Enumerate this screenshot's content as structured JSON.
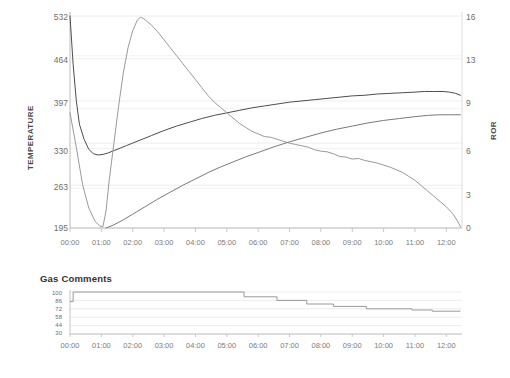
{
  "chart_data": [
    {
      "id": "roast-profile",
      "type": "line",
      "title": "",
      "xlabel": "",
      "ylabel": "TEMPERATURE",
      "y2label": "ROR",
      "grid": true,
      "legend": "none",
      "x_ticks": [
        "00:00",
        "01:00",
        "02:00",
        "03:00",
        "04:00",
        "05:00",
        "06:00",
        "07:00",
        "08:00",
        "09:00",
        "10:00",
        "11:00",
        "12:00"
      ],
      "xlim": [
        0,
        12.5
      ],
      "y_ticks": [
        195,
        263,
        330,
        397,
        464,
        532
      ],
      "ylim": [
        195,
        532
      ],
      "y2_ticks": [
        0,
        3,
        6,
        9,
        13,
        16
      ],
      "y2lim": [
        0,
        16
      ],
      "series": [
        {
          "name": "Bean Temperature",
          "axis": "left",
          "color": "#4d4d4d",
          "x": [
            0.0,
            0.1,
            0.2,
            0.3,
            0.45,
            0.6,
            0.75,
            0.9,
            1.05,
            1.2,
            1.4,
            1.6,
            1.8,
            2.0,
            2.3,
            2.6,
            3.0,
            3.4,
            3.8,
            4.2,
            4.6,
            5.0,
            5.4,
            5.8,
            6.2,
            6.6,
            7.0,
            7.4,
            7.8,
            8.2,
            8.6,
            9.0,
            9.4,
            9.8,
            10.2,
            10.6,
            11.0,
            11.3,
            11.6,
            11.9,
            12.1,
            12.3,
            12.45
          ],
          "y": [
            532,
            455,
            398,
            360,
            336,
            320,
            313,
            311,
            312,
            314,
            318,
            322,
            326,
            330,
            336,
            342,
            350,
            357,
            363,
            369,
            374,
            378,
            382,
            386,
            389,
            392,
            395,
            397,
            399,
            401,
            403,
            405,
            406,
            408,
            409,
            410,
            411,
            412,
            412,
            412,
            411,
            409,
            406
          ]
        },
        {
          "name": "Rate of Rise (ROR)",
          "axis": "right",
          "color": "#9a9a9a",
          "x": [
            0.0,
            0.2,
            0.4,
            0.6,
            0.8,
            0.95,
            1.05,
            1.15,
            1.25,
            1.4,
            1.55,
            1.7,
            1.85,
            2.0,
            2.15,
            2.25,
            2.35,
            2.45,
            2.6,
            2.8,
            3.0,
            3.2,
            3.4,
            3.6,
            3.8,
            4.0,
            4.2,
            4.4,
            4.6,
            4.8,
            5.0,
            5.2,
            5.4,
            5.6,
            5.8,
            6.0,
            6.2,
            6.4,
            6.6,
            6.8,
            7.0,
            7.2,
            7.4,
            7.6,
            7.8,
            8.0,
            8.2,
            8.4,
            8.6,
            8.8,
            9.0,
            9.2,
            9.4,
            9.6,
            9.8,
            10.0,
            10.2,
            10.4,
            10.6,
            10.8,
            11.0,
            11.2,
            11.4,
            11.6,
            11.8,
            12.0,
            12.2,
            12.35,
            12.45
          ],
          "y": [
            8.7,
            6.1,
            3.3,
            1.5,
            0.5,
            0.15,
            0.1,
            1.3,
            3.6,
            6.4,
            9.2,
            11.7,
            13.6,
            14.9,
            15.7,
            15.9,
            15.8,
            15.6,
            15.3,
            14.8,
            14.2,
            13.6,
            13.0,
            12.4,
            11.8,
            11.2,
            10.6,
            10.0,
            9.5,
            9.1,
            8.7,
            8.3,
            7.9,
            7.6,
            7.3,
            7.1,
            6.9,
            6.85,
            6.7,
            6.55,
            6.4,
            6.3,
            6.2,
            6.1,
            5.9,
            5.8,
            5.75,
            5.6,
            5.4,
            5.35,
            5.2,
            5.25,
            5.1,
            5.0,
            4.9,
            4.75,
            4.6,
            4.4,
            4.2,
            3.9,
            3.6,
            3.2,
            2.8,
            2.4,
            2.0,
            1.6,
            1.1,
            0.55,
            0.1
          ]
        },
        {
          "name": "Environment Temperature",
          "axis": "left",
          "color": "#7a7a7a",
          "x": [
            1.15,
            1.4,
            1.7,
            2.0,
            2.4,
            2.8,
            3.2,
            3.6,
            4.0,
            4.4,
            4.8,
            5.2,
            5.6,
            6.0,
            6.5,
            7.0,
            7.5,
            8.0,
            8.5,
            9.0,
            9.5,
            10.0,
            10.5,
            11.0,
            11.4,
            11.8,
            12.1,
            12.45
          ],
          "y": [
            195,
            200,
            208,
            217,
            229,
            241,
            252,
            263,
            273,
            283,
            292,
            300,
            308,
            315,
            324,
            332,
            339,
            346,
            352,
            357,
            362,
            366,
            369,
            372,
            374,
            375,
            375,
            375
          ]
        }
      ]
    },
    {
      "id": "gas-comments",
      "type": "line",
      "title": "Gas Comments",
      "xlabel": "",
      "ylabel": "",
      "grid": true,
      "legend": "none",
      "x_ticks": [
        "00:00",
        "01:00",
        "02:00",
        "03:00",
        "04:00",
        "05:00",
        "06:00",
        "07:00",
        "08:00",
        "09:00",
        "10:00",
        "11:00",
        "12:00"
      ],
      "xlim": [
        0,
        12.5
      ],
      "y_ticks": [
        30,
        44,
        58,
        72,
        86,
        100
      ],
      "ylim": [
        30,
        100
      ],
      "series": [
        {
          "name": "Gas Setting",
          "color": "#9a9a9a",
          "step": "post",
          "x": [
            0.0,
            0.1,
            5.55,
            6.6,
            7.55,
            8.4,
            9.45,
            10.9,
            11.55,
            12.45
          ],
          "y": [
            84,
            100,
            92,
            86,
            80,
            76,
            72,
            70,
            68,
            68
          ]
        }
      ]
    }
  ]
}
